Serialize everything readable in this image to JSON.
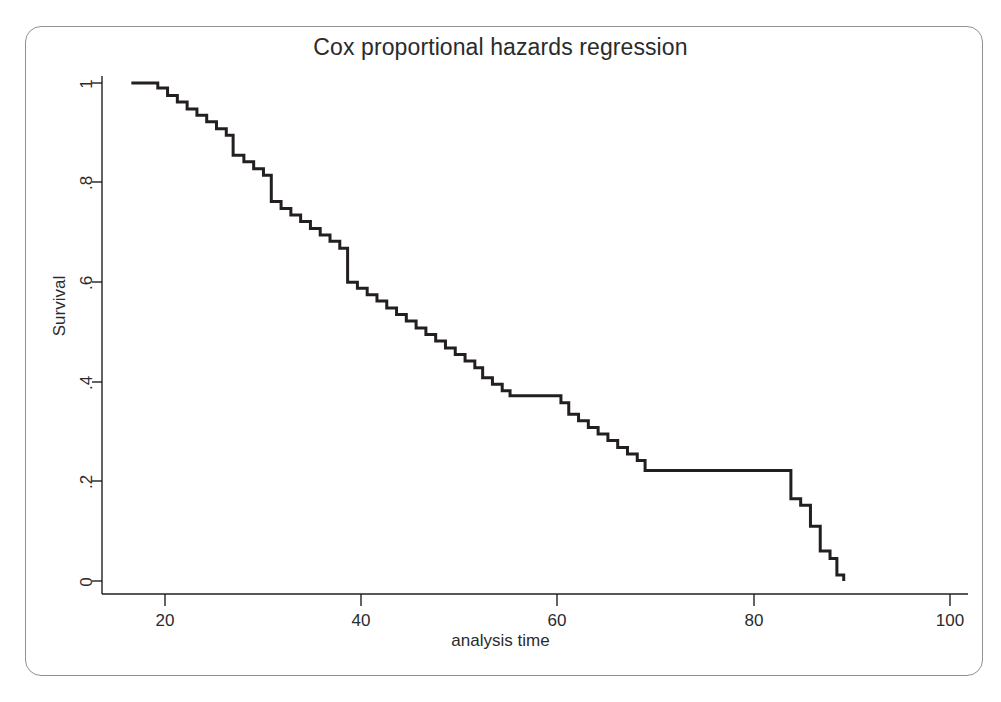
{
  "figure": {
    "title": "Cox proportional hazards regression",
    "frame_color": "#8f9194",
    "background": "#ffffff",
    "line_color": "#231f20",
    "axis_color": "#231f20"
  },
  "axes": {
    "x": {
      "label": "analysis time",
      "ticks": [
        "20",
        "40",
        "60",
        "80",
        "100"
      ],
      "tick_values": [
        20,
        40,
        60,
        80,
        100
      ],
      "range": [
        13.5,
        102
      ]
    },
    "y": {
      "label": "Survival",
      "ticks": [
        "0",
        ".2",
        ".4",
        ".6",
        ".8",
        "1"
      ],
      "tick_values": [
        0,
        0.2,
        0.4,
        0.6,
        0.8,
        1
      ],
      "range": [
        0,
        1
      ]
    }
  },
  "chart_data": {
    "type": "line",
    "subtype": "step-survival-curve",
    "title": "Cox proportional hazards regression",
    "xlabel": "analysis time",
    "ylabel": "Survival",
    "xlim": [
      13.5,
      102
    ],
    "ylim": [
      0,
      1
    ],
    "xticks": [
      20,
      40,
      60,
      80,
      100
    ],
    "yticks": [
      0,
      0.2,
      0.4,
      0.6,
      0.8,
      1
    ],
    "grid": false,
    "legend": null,
    "series": [
      {
        "name": "Survival",
        "step": "post",
        "x": [
          16.5,
          19.2,
          20.2,
          21.2,
          22.2,
          23.2,
          24.2,
          25.2,
          26.2,
          26.9,
          28.0,
          29.0,
          30.0,
          30.8,
          31.8,
          32.8,
          33.8,
          34.8,
          35.8,
          36.8,
          37.8,
          38.6,
          39.6,
          40.6,
          41.6,
          42.6,
          43.6,
          44.6,
          45.6,
          46.6,
          47.6,
          48.6,
          49.6,
          50.6,
          51.6,
          52.4,
          53.4,
          54.4,
          55.2,
          60.4,
          61.2,
          62.2,
          63.2,
          64.2,
          65.2,
          66.2,
          67.2,
          68.2,
          69.0,
          83.0,
          83.9,
          84.9,
          85.9,
          86.9,
          87.9,
          88.6,
          89.3
        ],
        "y": [
          1.0,
          0.99,
          0.975,
          0.962,
          0.948,
          0.935,
          0.922,
          0.908,
          0.895,
          0.855,
          0.842,
          0.828,
          0.815,
          0.762,
          0.748,
          0.735,
          0.722,
          0.708,
          0.695,
          0.682,
          0.668,
          0.6,
          0.588,
          0.575,
          0.562,
          0.548,
          0.535,
          0.522,
          0.508,
          0.495,
          0.482,
          0.468,
          0.455,
          0.442,
          0.428,
          0.408,
          0.395,
          0.382,
          0.372,
          0.358,
          0.335,
          0.322,
          0.308,
          0.295,
          0.282,
          0.268,
          0.255,
          0.242,
          0.222,
          0.222,
          0.165,
          0.152,
          0.11,
          0.06,
          0.045,
          0.012,
          0.0
        ]
      }
    ]
  }
}
